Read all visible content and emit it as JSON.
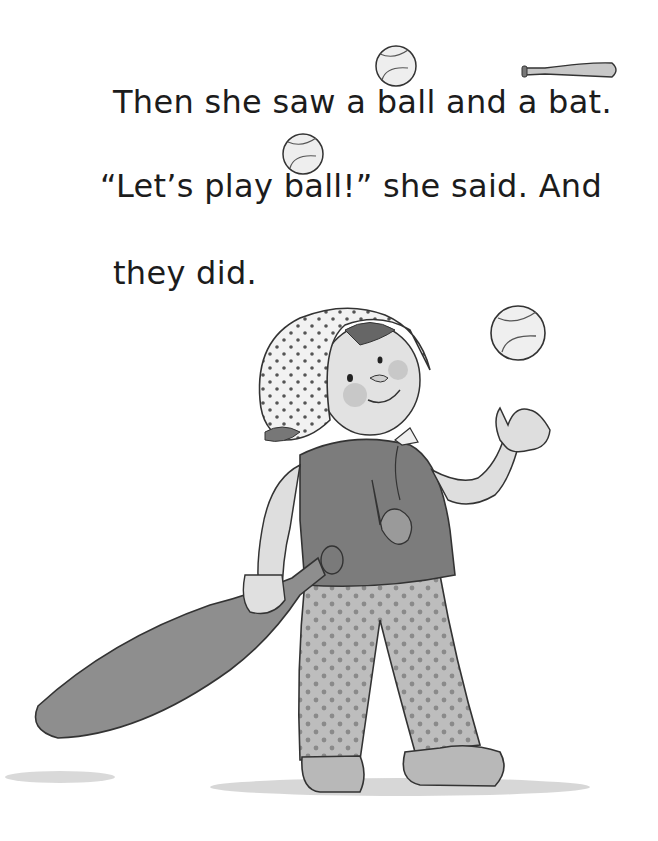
{
  "page": {
    "text_lines": [
      "Then she saw a ball and a bat.",
      "“Let’s play ball!” she said. And",
      "they did."
    ],
    "illustration": {
      "subject": "girl in polka-dot bonnet tossing a baseball while holding a bat",
      "inline_icons": [
        "baseball-icon",
        "bat-icon",
        "baseball-icon"
      ],
      "palette": {
        "ink": "#2a2a2a",
        "shirt": "#7c7c7c",
        "pants": "#bdbdbd",
        "bat": "#8e8e8e",
        "skin": "#dedede",
        "shadow": "#c8c8c8"
      }
    }
  }
}
